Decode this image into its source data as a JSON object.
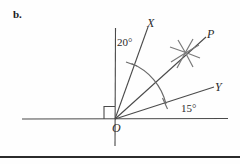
{
  "figure": {
    "part_label": "b.",
    "background_color": "#fefefe",
    "stroke_color": "#4a4a4a",
    "text_color": "#2a2a2a",
    "labels": {
      "origin": "O",
      "ray_x": "X",
      "ray_p": "P",
      "ray_y": "Y",
      "angle_x_from_vertical": "20°",
      "angle_y_from_horizontal": "15°"
    },
    "construction": {
      "right_angle_marker": "square",
      "arc_marker": "angle-bisector-arc",
      "intersection_marker": "compass-arc-star"
    }
  }
}
